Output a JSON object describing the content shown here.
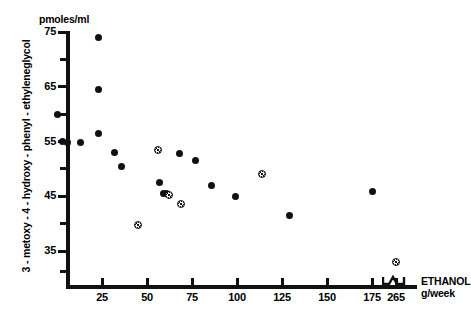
{
  "chart_data": {
    "type": "scatter",
    "title": "",
    "xlabel": "ETHANOL g/week",
    "ylabel": "3 - metoxy - 4 - hydroxy - phenyl - ethyleneglycol",
    "yunit": "pmoles/ml",
    "xlim": [
      0,
      190
    ],
    "ylim": [
      30,
      75
    ],
    "grid": false,
    "legend": "none",
    "x_ticks": [
      {
        "label": "25",
        "value": 25
      },
      {
        "label": "50",
        "value": 50
      },
      {
        "label": "75",
        "value": 75
      },
      {
        "label": "100",
        "value": 100
      },
      {
        "label": "125",
        "value": 125
      },
      {
        "label": "150",
        "value": 150
      },
      {
        "label": "175",
        "value": 175
      },
      {
        "label": "265",
        "value": 265
      }
    ],
    "x_axis_break": {
      "between": [
        175,
        265
      ],
      "symbol": "zigzag"
    },
    "y_ticks_major": [
      "75",
      "65",
      "55",
      "45",
      "35"
    ],
    "y_ticks_major_values": [
      75,
      65,
      55,
      45,
      35
    ],
    "y_ticks_minor_values": [
      70,
      60,
      50,
      40
    ],
    "series": [
      {
        "name": "filled-circle",
        "marker": "filled-circle",
        "points": [
          {
            "x": 0,
            "y": 60.0
          },
          {
            "x": 3,
            "y": 55.0
          },
          {
            "x": 6,
            "y": 54.8
          },
          {
            "x": 13,
            "y": 54.8
          },
          {
            "x": 23,
            "y": 74.0
          },
          {
            "x": 23,
            "y": 64.5
          },
          {
            "x": 23,
            "y": 56.5
          },
          {
            "x": 32,
            "y": 53.0
          },
          {
            "x": 36,
            "y": 50.5
          },
          {
            "x": 57,
            "y": 47.5
          },
          {
            "x": 59,
            "y": 45.5
          },
          {
            "x": 61,
            "y": 45.5
          },
          {
            "x": 68,
            "y": 52.8
          },
          {
            "x": 77,
            "y": 51.5
          },
          {
            "x": 86,
            "y": 47.0
          },
          {
            "x": 99,
            "y": 45.0
          },
          {
            "x": 129,
            "y": 41.5
          },
          {
            "x": 175,
            "y": 45.8
          }
        ]
      },
      {
        "name": "hatched-circle",
        "marker": "hatched-circle",
        "points": [
          {
            "x": 45,
            "y": 39.8
          },
          {
            "x": 56,
            "y": 53.5
          },
          {
            "x": 62,
            "y": 45.3
          },
          {
            "x": 69,
            "y": 43.5
          },
          {
            "x": 114,
            "y": 49.0
          },
          {
            "x": 265,
            "y": 33.0
          }
        ]
      }
    ]
  },
  "axis": {
    "y_unit_label": "pmoles/ml",
    "y_title": "3 - metoxy - 4 - hydroxy - phenyl - ethyleneglycol",
    "x_title_line1": "ETHANOL",
    "x_title_line2": "g/week"
  }
}
